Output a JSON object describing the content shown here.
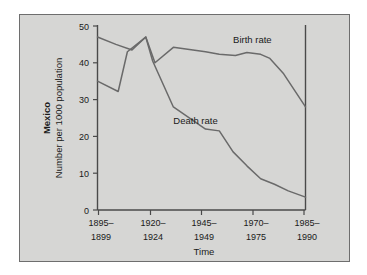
{
  "figure": {
    "panel_background": "#d6d6d4",
    "page_background": "#ffffff",
    "line_color": "#6a6a6a",
    "axis_color": "#4a4a4a"
  },
  "chart_data": {
    "type": "line",
    "title": "",
    "subtitle": "",
    "region_label": "Mexico",
    "ylabel": "Number per 1000 population",
    "xlabel": "Time",
    "ylim": [
      0,
      50
    ],
    "ytick_values": [
      0,
      10,
      20,
      30,
      40,
      50
    ],
    "ytick_labels": [
      "0",
      "10",
      "20",
      "30",
      "40",
      "50"
    ],
    "grid": false,
    "legend_position": "inline-annotation",
    "categories": [
      "1895–1899",
      "1920–1924",
      "1945–1949",
      "1970–1975",
      "1985–1990"
    ],
    "xtick_labels_line1": [
      "1895–",
      "1920–",
      "1945–",
      "1970–",
      "1985–"
    ],
    "xtick_labels_line2": [
      "1899",
      "1924",
      "1949",
      "1975",
      "1990"
    ],
    "xlim": [
      1897,
      1987.5
    ],
    "series": [
      {
        "name": "Birth rate",
        "label_x": 1956,
        "label_y": 45.5,
        "x": [
          1897,
          1905,
          1912,
          1918,
          1922,
          1930,
          1937,
          1944,
          1950,
          1957,
          1962,
          1968,
          1972,
          1978,
          1987.5
        ],
        "values": [
          47.0,
          45.0,
          43.5,
          47.0,
          40.0,
          44.2,
          43.6,
          43.0,
          42.3,
          42.0,
          42.8,
          42.3,
          41.2,
          37.0,
          28.0
        ]
      },
      {
        "name": "Death rate",
        "label_x": 1930,
        "label_y": 23.5,
        "x": [
          1897,
          1906,
          1910,
          1918,
          1921,
          1930,
          1944,
          1950,
          1956,
          1962,
          1968,
          1974,
          1980,
          1987.5
        ],
        "values": [
          35.0,
          32.2,
          43.0,
          47.0,
          40.5,
          28.0,
          22.0,
          21.5,
          15.8,
          12.0,
          8.5,
          7.0,
          5.2,
          3.5
        ]
      }
    ]
  }
}
